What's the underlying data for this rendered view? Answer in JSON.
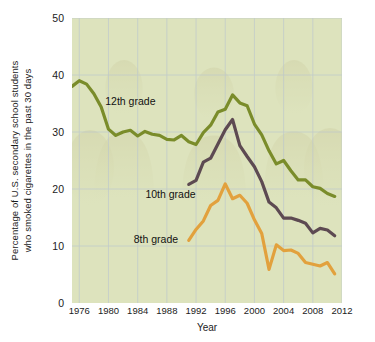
{
  "chart_data": {
    "type": "line",
    "title": "",
    "xlabel": "Year",
    "ylabel_line1": "Percentage of U.S. secondary school students",
    "ylabel_line2": "who smoked cigarettes in the past 30 days",
    "xlim": [
      1975,
      2012
    ],
    "ylim": [
      0,
      50
    ],
    "xticks": [
      1976,
      1980,
      1984,
      1988,
      1992,
      1996,
      2000,
      2004,
      2008,
      2012
    ],
    "yticks": [
      0,
      10,
      20,
      30,
      40,
      50
    ],
    "grid": true,
    "legend_position": "inline-annotations",
    "plot_background": "#dde3bd",
    "series": [
      {
        "name": "12th grade",
        "color": "#7a8c2a",
        "label_x": 1983.0,
        "label_y": 35.5,
        "x": [
          1975,
          1976,
          1977,
          1978,
          1979,
          1980,
          1981,
          1982,
          1983,
          1984,
          1985,
          1986,
          1987,
          1988,
          1989,
          1990,
          1991,
          1992,
          1993,
          1994,
          1995,
          1996,
          1997,
          1998,
          1999,
          2000,
          2001,
          2002,
          2003,
          2004,
          2005,
          2006,
          2007,
          2008,
          2009,
          2010,
          2011
        ],
        "y": [
          38.0,
          39.0,
          38.4,
          36.7,
          34.4,
          30.5,
          29.4,
          30.0,
          30.3,
          29.3,
          30.1,
          29.6,
          29.4,
          28.7,
          28.6,
          29.4,
          28.3,
          27.8,
          29.9,
          31.2,
          33.5,
          34.0,
          36.5,
          35.1,
          34.6,
          31.4,
          29.5,
          26.7,
          24.4,
          25.0,
          23.2,
          21.6,
          21.6,
          20.4,
          20.1,
          19.2,
          18.7
        ]
      },
      {
        "name": "10th grade",
        "color": "#5d4a52",
        "label_x": 1988.5,
        "label_y": 19.2,
        "x": [
          1991,
          1992,
          1993,
          1994,
          1995,
          1996,
          1997,
          1998,
          1999,
          2000,
          2001,
          2002,
          2003,
          2004,
          2005,
          2006,
          2007,
          2008,
          2009,
          2010,
          2011
        ],
        "y": [
          20.8,
          21.5,
          24.7,
          25.4,
          27.9,
          30.4,
          32.2,
          27.6,
          25.7,
          23.9,
          21.3,
          17.7,
          16.7,
          14.9,
          14.9,
          14.5,
          14.0,
          12.3,
          13.1,
          12.8,
          11.8
        ]
      },
      {
        "name": "8th grade",
        "color": "#e2a13d",
        "label_x": 1986.5,
        "label_y": 11.3,
        "x": [
          1991,
          1992,
          1993,
          1994,
          1995,
          1996,
          1997,
          1998,
          1999,
          2000,
          2001,
          2002,
          2003,
          2004,
          2005,
          2006,
          2007,
          2008,
          2009,
          2010,
          2011
        ],
        "y": [
          11.0,
          12.9,
          14.4,
          17.1,
          18.0,
          20.9,
          18.3,
          18.9,
          17.5,
          14.6,
          12.2,
          5.9,
          10.2,
          9.2,
          9.3,
          8.7,
          7.1,
          6.8,
          6.5,
          7.1,
          5.1
        ]
      }
    ]
  },
  "axes": {
    "y_label_line1": "Percentage of U.S. secondary school students",
    "y_label_line2": "who smoked cigarettes in the past 30 days",
    "x_label": "Year"
  }
}
